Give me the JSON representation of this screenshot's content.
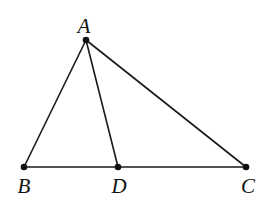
{
  "diagram": {
    "type": "triangle-with-cevian",
    "points": {
      "A": {
        "label": "A",
        "x": 86,
        "y": 40
      },
      "B": {
        "label": "B",
        "x": 24,
        "y": 167
      },
      "D": {
        "label": "D",
        "x": 118,
        "y": 167
      },
      "C": {
        "label": "C",
        "x": 246,
        "y": 167
      }
    },
    "segments": [
      [
        "A",
        "B"
      ],
      [
        "A",
        "D"
      ],
      [
        "A",
        "C"
      ],
      [
        "B",
        "D"
      ],
      [
        "D",
        "C"
      ]
    ],
    "colors": {
      "stroke": "#1a1a1a",
      "point": "#111111",
      "background": "#ffffff"
    }
  }
}
